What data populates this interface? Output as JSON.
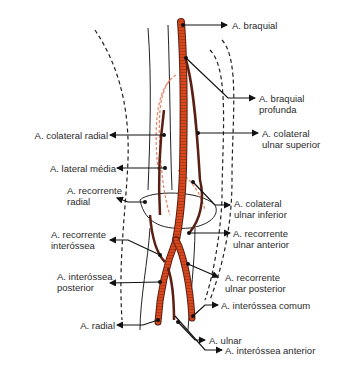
{
  "figure": {
    "type": "anatomical-diagram",
    "colors": {
      "artery": "#d9471c",
      "artery_outline": "#5a1f12",
      "deep_artery_dashed": "#e8896c",
      "leader_line": "#111111",
      "contour_dashed": "#222222"
    }
  },
  "labels": {
    "braquial": "A. braquial",
    "braquial_profunda_1": "A. braquial",
    "braquial_profunda_2": "profunda",
    "colateral_radial": "A. colateral radial",
    "colateral_ulnar_superior_1": "A. colateral",
    "colateral_ulnar_superior_2": "ulnar superior",
    "lateral_media": "A. lateral média",
    "recorrente_radial_1": "A. recorrente",
    "recorrente_radial_2": "radial",
    "colateral_ulnar_inferior_1": "A. colateral",
    "colateral_ulnar_inferior_2": "ulnar inferior",
    "recorrente_interossea_1": "A. recorrente",
    "recorrente_interossea_2": "interóssea",
    "recorrente_ulnar_anterior_1": "A. recorrente",
    "recorrente_ulnar_anterior_2": "ulnar anterior",
    "interossea_posterior_1": "A. interóssea",
    "interossea_posterior_2": "posterior",
    "recorrente_ulnar_posterior_1": "A. recorrente",
    "recorrente_ulnar_posterior_2": "ulnar posterior",
    "interossea_comum": "A. interóssea comum",
    "radial": "A. radial",
    "ulnar": "A. ulnar",
    "interossea_anterior": "A. interóssea anterior"
  }
}
